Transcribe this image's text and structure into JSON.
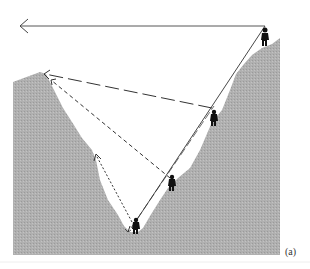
{
  "figure": {
    "label": "(a)",
    "colors": {
      "terrain": "#a9a9a9",
      "lines": "#222222",
      "figures": "#111111",
      "background": "#ffffff"
    },
    "elements": {
      "hikers": [
        {
          "name": "hiker-top-right",
          "position": "summit of right ridge"
        },
        {
          "name": "hiker-upper-right-slope",
          "position": "upper right slope"
        },
        {
          "name": "hiker-mid-slope",
          "position": "mid right slope"
        },
        {
          "name": "hiker-valley-floor",
          "position": "valley floor"
        }
      ],
      "sight_lines": [
        {
          "name": "solid-horizontal",
          "style": "solid",
          "from": "hiker-top-right",
          "to": "horizon left"
        },
        {
          "name": "solid-diagonal",
          "style": "solid",
          "from": "hiker-valley-floor",
          "to": "hiker-top-right"
        },
        {
          "name": "long-dashed",
          "style": "long-dash",
          "from": "hiker-upper-right-slope",
          "to": "left peak"
        },
        {
          "name": "medium-dashed",
          "style": "dashed",
          "from": "hiker-mid-slope",
          "to": "left peak"
        },
        {
          "name": "dotted-long",
          "style": "dotted",
          "from": "hiker-valley-floor",
          "to": "left slope"
        },
        {
          "name": "dotted-short",
          "style": "dotted",
          "from": "hiker-valley-floor",
          "to": "left slope lower"
        }
      ]
    }
  }
}
